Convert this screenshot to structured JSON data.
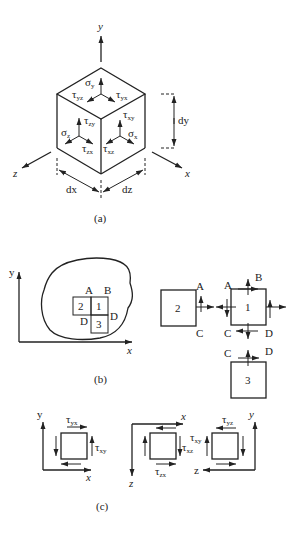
{
  "figure": {
    "panel_a": {
      "caption": "(a)",
      "axes": {
        "x": "x",
        "y": "y",
        "z": "z"
      },
      "dimensions": {
        "dx": "dx",
        "dy": "dy",
        "dz": "dz"
      },
      "stress_labels": {
        "sigma_y": {
          "sym": "σ",
          "sub": "y"
        },
        "tau_yz": {
          "sym": "τ",
          "sub": "yz"
        },
        "tau_yx": {
          "sym": "τ",
          "sub": "yx"
        },
        "tau_zy": {
          "sym": "τ",
          "sub": "zy"
        },
        "sigma_z": {
          "sym": "σ",
          "sub": "z"
        },
        "tau_zx": {
          "sym": "τ",
          "sub": "zx"
        },
        "tau_xy": {
          "sym": "τ",
          "sub": "xy"
        },
        "sigma_x": {
          "sym": "σ",
          "sub": "x"
        },
        "tau_xz": {
          "sym": "τ",
          "sub": "xz"
        }
      }
    },
    "panel_b": {
      "caption": "(b)",
      "axes": {
        "x": "x",
        "y": "y"
      },
      "elements": [
        "1",
        "2",
        "3"
      ],
      "points": {
        "A": "A",
        "B": "B",
        "C": "C",
        "D": "D"
      }
    },
    "panel_c": {
      "caption": "(c)",
      "views": [
        {
          "axes": {
            "h": "x",
            "v": "y"
          },
          "top": {
            "sym": "τ",
            "sub": "yx"
          },
          "side": {
            "sym": "τ",
            "sub": "xy"
          }
        },
        {
          "axes": {
            "h": "x",
            "v": "z"
          },
          "side": {
            "sym": "τ",
            "sub": "xz"
          },
          "bottom": {
            "sym": "τ",
            "sub": "zx"
          }
        },
        {
          "axes": {
            "h": "z",
            "v": "y"
          },
          "top": {
            "sym": "τ",
            "sub": "yz"
          },
          "side": {
            "sym": "τ",
            "sub": "xy"
          }
        }
      ]
    }
  }
}
